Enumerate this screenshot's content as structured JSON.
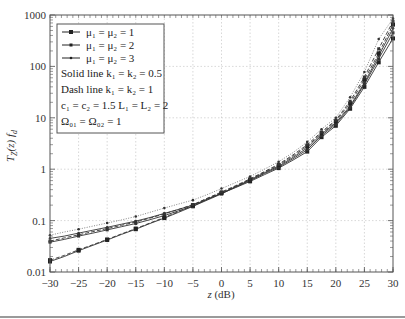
{
  "chart_data": {
    "type": "line",
    "title": "",
    "xlabel": "z (dB)",
    "ylabel": "T_Z(z) f_d",
    "xlim": [
      -30,
      30
    ],
    "ylim": [
      0.01,
      1000
    ],
    "yscale": "log",
    "grid": true,
    "legend_position": "upper left",
    "x_ticks": [
      -30,
      -25,
      -20,
      -15,
      -10,
      -5,
      0,
      5,
      10,
      15,
      20,
      25,
      30
    ],
    "y_ticks": [
      0.01,
      0.1,
      1,
      10,
      100,
      1000
    ],
    "x_tick_labels": [
      "−30",
      "−25",
      "−20",
      "−15",
      "−10",
      "−5",
      "0",
      "5",
      "10",
      "15",
      "20",
      "25",
      "30"
    ],
    "y_tick_labels": [
      "0.01",
      "0.1",
      "1",
      "10",
      "100",
      "1000"
    ],
    "x": [
      -30,
      -27.5,
      -25,
      -22.5,
      -20,
      -17.5,
      -15,
      -12.5,
      -10,
      -7.5,
      -5,
      -2.5,
      0,
      2.5,
      5,
      7.5,
      10,
      12.5,
      15,
      17.5,
      20,
      22.5,
      25,
      27.5,
      30
    ],
    "series": [
      {
        "name": "μ1 = μ2 = 1, k1 = k2 = 0.5",
        "style": "solid",
        "marker": "square",
        "values": [
          0.016,
          0.02,
          0.026,
          0.033,
          0.042,
          0.054,
          0.068,
          0.088,
          0.112,
          0.145,
          0.19,
          0.26,
          0.34,
          0.44,
          0.58,
          0.78,
          1.05,
          1.5,
          2.2,
          4.2,
          7.0,
          15,
          40,
          120,
          350
        ]
      },
      {
        "name": "μ1 = μ2 = 2, k1 = k2 = 0.5",
        "style": "solid",
        "marker": "diamond",
        "values": [
          0.038,
          0.043,
          0.05,
          0.057,
          0.066,
          0.076,
          0.088,
          0.104,
          0.125,
          0.155,
          0.19,
          0.25,
          0.33,
          0.45,
          0.6,
          0.82,
          1.1,
          1.6,
          2.4,
          4.5,
          7.5,
          16,
          45,
          140,
          450
        ]
      },
      {
        "name": "μ1 = μ2 = 3, k1 = k2 = 0.5",
        "style": "solid",
        "marker": "dot",
        "values": [
          0.045,
          0.05,
          0.057,
          0.065,
          0.074,
          0.085,
          0.098,
          0.115,
          0.138,
          0.165,
          0.2,
          0.26,
          0.34,
          0.46,
          0.62,
          0.85,
          1.15,
          1.7,
          2.6,
          4.8,
          8.0,
          17,
          48,
          160,
          550
        ]
      },
      {
        "name": "μ1 = μ2 = 1, k1 = k2 = 1",
        "style": "dash",
        "marker": "square",
        "values": [
          0.017,
          0.021,
          0.027,
          0.034,
          0.043,
          0.055,
          0.07,
          0.09,
          0.115,
          0.15,
          0.2,
          0.27,
          0.35,
          0.47,
          0.63,
          0.87,
          1.2,
          1.8,
          2.8,
          5.0,
          8.5,
          19,
          55,
          180,
          650
        ]
      },
      {
        "name": "μ1 = μ2 = 2, k1 = k2 = 1",
        "style": "dash",
        "marker": "diamond",
        "values": [
          0.04,
          0.046,
          0.053,
          0.061,
          0.07,
          0.081,
          0.094,
          0.112,
          0.135,
          0.165,
          0.205,
          0.27,
          0.36,
          0.48,
          0.65,
          0.9,
          1.25,
          1.9,
          3.0,
          5.3,
          9.0,
          21,
          62,
          220,
          750
        ]
      },
      {
        "name": "μ1 = μ2 = 3, k1 = k2 = 1",
        "style": "dotted",
        "marker": "dot",
        "values": [
          0.052,
          0.06,
          0.068,
          0.078,
          0.09,
          0.103,
          0.12,
          0.145,
          0.175,
          0.21,
          0.25,
          0.32,
          0.42,
          0.55,
          0.72,
          1.0,
          1.4,
          2.1,
          3.4,
          6.0,
          10,
          25,
          78,
          340,
          850
        ]
      }
    ],
    "legend": {
      "entries": [
        "μ1 = μ2 = 1",
        "μ1 = μ2 = 2",
        "μ1 = μ2 = 3"
      ],
      "notes": [
        "Solid line k1 = k2 = 0.5",
        "Dash line k1 = k2 = 1",
        "c1 = c2 = 1.5   L1 = L2 = 2",
        "Ω01 = Ω02 = 1"
      ]
    }
  },
  "labels": {
    "xlabel": "z (dB)",
    "legend_mu1": "μ₁ = μ₂ = 1",
    "legend_mu2": "μ₁ = μ₂ = 2",
    "legend_mu3": "μ₁ = μ₂ = 3",
    "note_solid": "Solid line k₁ = k₂ = 0.5",
    "note_dash": "Dash line k₁ = k₂ = 1",
    "note_params": "c₁ = c₂ = 1.5   L₁ = L₂ = 2",
    "note_omega": "Ω₀₁ = Ω₀₂ = 1"
  }
}
